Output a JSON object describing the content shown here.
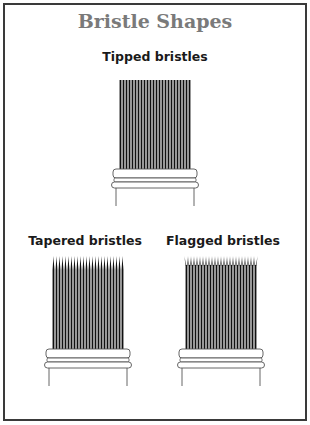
{
  "title": "Bristle Shapes",
  "brushes": [
    {
      "id": "tipped",
      "label": "Tipped bristles",
      "tip": "blunt"
    },
    {
      "id": "tapered",
      "label": "Tapered bristles",
      "tip": "tapered"
    },
    {
      "id": "flagged",
      "label": "Flagged bristles",
      "tip": "flagged"
    }
  ],
  "colors": {
    "frame": "#3a3a3a",
    "title": "#7a7a7a",
    "bristle": "#111111",
    "ferrule_line": "#555555"
  }
}
